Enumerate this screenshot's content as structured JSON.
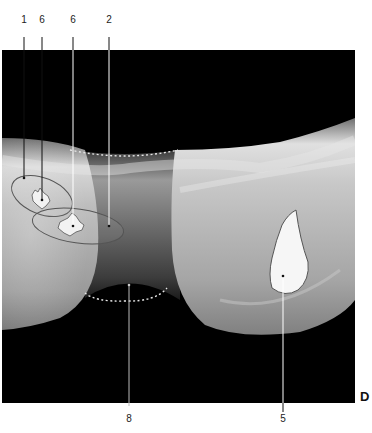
{
  "figure": {
    "panel_letter": "D",
    "background_color": "#000000",
    "outline_color": "#555555",
    "dotted_line_color": "#e8e8e8",
    "leader_line_color": "#ffffff",
    "labels": [
      {
        "id": "1",
        "text": "1",
        "x": 24,
        "y": 25,
        "point": [
          24,
          178
        ]
      },
      {
        "id": "6a",
        "text": "6",
        "x": 42,
        "y": 25,
        "point": [
          42,
          200
        ]
      },
      {
        "id": "6b",
        "text": "6",
        "x": 73,
        "y": 25,
        "point": [
          73,
          226
        ]
      },
      {
        "id": "2",
        "text": "2",
        "x": 109,
        "y": 25,
        "point": [
          109,
          226
        ]
      },
      {
        "id": "8",
        "text": "8",
        "x": 129,
        "y": 418,
        "point": [
          129,
          285
        ]
      },
      {
        "id": "5",
        "text": "5",
        "x": 283,
        "y": 418,
        "point": [
          283,
          276
        ]
      }
    ]
  }
}
